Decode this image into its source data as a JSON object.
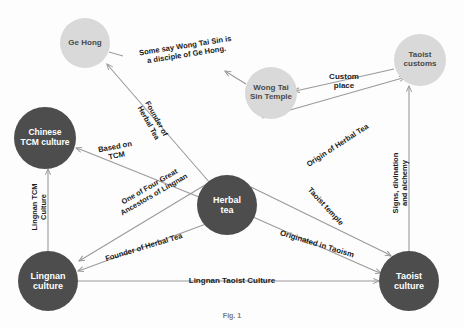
{
  "diagram": {
    "canvas": {
      "width": 464,
      "height": 328,
      "background": "#fdfdfd"
    },
    "colors": {
      "node_dark": "#4d4d4d",
      "node_light": "#d9d9d9",
      "node_light_alt": "#dcdcdc",
      "edge": "#9a9a9a",
      "label_text": "#1a1a1a",
      "node_text_dark_bg": "#ffffff",
      "node_text_light_bg": "#4a4a4a"
    },
    "caption": "Fig. 1",
    "nodes": [
      {
        "id": "ge-hong",
        "label": "Ge Hong",
        "cx": 85,
        "cy": 43,
        "r": 25,
        "style": "light",
        "font_size": 8
      },
      {
        "id": "wong-tai-sin-temple",
        "label": "Wong Tai\nSin Temple",
        "cx": 271,
        "cy": 93,
        "r": 26,
        "style": "light",
        "font_size": 8
      },
      {
        "id": "taoist-customs",
        "label": "Taoist\ncustoms",
        "cx": 420,
        "cy": 60,
        "r": 26,
        "style": "light",
        "font_size": 8
      },
      {
        "id": "chinese-tcm-culture",
        "label": "Chinese\nTCM culture",
        "cx": 45,
        "cy": 138,
        "r": 31,
        "style": "dark",
        "font_size": 8.5
      },
      {
        "id": "herbal-tea",
        "label": "Herbal\ntea",
        "cx": 227,
        "cy": 205,
        "r": 30,
        "style": "dark",
        "font_size": 9
      },
      {
        "id": "lingnan-culture",
        "label": "Lingnan\nculture",
        "cx": 48,
        "cy": 281,
        "r": 30,
        "style": "dark",
        "font_size": 9
      },
      {
        "id": "taoist-culture",
        "label": "Taoist\nculture",
        "cx": 409,
        "cy": 281,
        "r": 30,
        "style": "dark",
        "font_size": 9
      }
    ],
    "edges": [
      {
        "id": "wts-temple-to-ge-hong",
        "from": "wong-tai-sin-temple",
        "to": "ge-hong",
        "label": "Some say Wong Tai Sin is\na disciple of Ge Hong.",
        "label_x": 186,
        "label_y": 51,
        "label_rotation": -9,
        "font_size": 7.6,
        "arrow": "end"
      },
      {
        "id": "herbal-tea-to-ge-hong",
        "from": "herbal-tea",
        "to": "ge-hong",
        "label": "Founder of\nHerbal Tea",
        "label_x": 152,
        "label_y": 121,
        "label_rotation": 61,
        "font_size": 7.4,
        "arrow": "end"
      },
      {
        "id": "herbal-tea-to-chinese-tcm",
        "from": "herbal-tea",
        "to": "chinese-tcm-culture",
        "label": "Based on\nTCM",
        "label_x": 116,
        "label_y": 152,
        "label_rotation": -11,
        "font_size": 7.6,
        "arrow": "end"
      },
      {
        "id": "herbal-tea-to-lingnan-culture-ancestors",
        "from": "herbal-tea",
        "to": "lingnan-culture",
        "label": "One of Four Great\nAncestors of Lingnan",
        "label_x": 152,
        "label_y": 191,
        "label_rotation": -30,
        "font_size": 7.4,
        "arrow": "end"
      },
      {
        "id": "herbal-tea-to-lingnan-culture-founder",
        "from": "herbal-tea",
        "to": "lingnan-culture",
        "label": "Founder of Herbal Tea",
        "label_x": 144,
        "label_y": 248,
        "label_rotation": -17,
        "font_size": 7.6,
        "arrow": "end"
      },
      {
        "id": "lingnan-culture-to-chinese-tcm",
        "from": "lingnan-culture",
        "to": "chinese-tcm-culture",
        "label": "Lingnan TCM\nCulture",
        "label_x": 40,
        "label_y": 207,
        "label_rotation": -90,
        "font_size": 7.4,
        "arrow": "end"
      },
      {
        "id": "taoist-customs-to-wts-temple",
        "from": "taoist-customs",
        "to": "wong-tai-sin-temple",
        "label": "Custom\nplace",
        "label_x": 344,
        "label_y": 81,
        "label_rotation": 0,
        "font_size": 8,
        "arrow": "end"
      },
      {
        "id": "wts-temple-to-taoist-customs-origin",
        "from": "wong-tai-sin-temple",
        "to": "taoist-customs",
        "label": "Origin of Herbal Tea",
        "label_x": 338,
        "label_y": 146,
        "label_rotation": -33,
        "font_size": 7.6,
        "arrow": "end"
      },
      {
        "id": "herbal-tea-to-taoist-culture-temple",
        "from": "herbal-tea",
        "to": "taoist-culture",
        "label": "Taoist temple",
        "label_x": 325,
        "label_y": 207,
        "label_rotation": 47,
        "font_size": 7.6,
        "arrow": "end"
      },
      {
        "id": "herbal-tea-to-taoist-culture-origin",
        "from": "herbal-tea",
        "to": "taoist-culture",
        "label": "Originated in Taoism",
        "label_x": 317,
        "label_y": 244,
        "label_rotation": 17,
        "font_size": 7.8,
        "arrow": "end"
      },
      {
        "id": "lingnan-culture-to-taoist-culture",
        "from": "lingnan-culture",
        "to": "taoist-culture",
        "label": "Lingnan Taoist Culture",
        "label_x": 232,
        "label_y": 281,
        "label_rotation": 0,
        "font_size": 8,
        "arrow": "end"
      },
      {
        "id": "taoist-culture-to-taoist-customs",
        "from": "taoist-culture",
        "to": "taoist-customs",
        "label": "Signs, divination and alchemy",
        "label_x": 401,
        "label_y": 183,
        "label_rotation": -90,
        "font_size": 7.6,
        "arrow": "end"
      }
    ],
    "lines": [
      {
        "id": "line-1",
        "x1": 109,
        "y1": 52,
        "x2": 123,
        "y2": 56,
        "arrow": "none"
      },
      {
        "id": "line-2",
        "x1": 246,
        "y1": 84,
        "x2": 233,
        "y2": 76,
        "arrow": "end",
        "ax": 225,
        "ay": 71
      },
      {
        "id": "line-3",
        "x1": 210,
        "y1": 183,
        "x2": 112,
        "y2": 70,
        "arrow": "end",
        "ax": 107,
        "ay": 64
      },
      {
        "id": "line-4",
        "x1": 199,
        "y1": 197,
        "x2": 82,
        "y2": 150,
        "arrow": "end",
        "ax": 76,
        "ay": 148
      },
      {
        "id": "line-5",
        "x1": 205,
        "y1": 185,
        "x2": 84,
        "y2": 258,
        "arrow": "end",
        "ax": 79,
        "ay": 261
      },
      {
        "id": "line-6",
        "x1": 206,
        "y1": 224,
        "x2": 84,
        "y2": 269,
        "arrow": "end",
        "ax": 78,
        "ay": 271
      },
      {
        "id": "line-7",
        "x1": 48,
        "y1": 251,
        "x2": 48,
        "y2": 175,
        "arrow": "end",
        "ax": 48,
        "ay": 169
      },
      {
        "id": "line-8",
        "x1": 394,
        "y1": 69,
        "x2": 300,
        "y2": 90,
        "arrow": "end",
        "ax": 294,
        "ay": 91
      },
      {
        "id": "line-9",
        "x1": 262,
        "y1": 118,
        "x2": 399,
        "y2": 79,
        "arrow": "end",
        "ax": 405,
        "ay": 77
      },
      {
        "id": "line-10",
        "x1": 251,
        "y1": 187,
        "x2": 386,
        "y2": 253,
        "arrow": "end",
        "ax": 391,
        "ay": 256
      },
      {
        "id": "line-11",
        "x1": 253,
        "y1": 217,
        "x2": 375,
        "y2": 271,
        "arrow": "end",
        "ax": 381,
        "ay": 273
      },
      {
        "id": "line-12",
        "x1": 78,
        "y1": 281,
        "x2": 373,
        "y2": 281,
        "arrow": "end",
        "ax": 379,
        "ay": 281
      },
      {
        "id": "line-13",
        "x1": 409,
        "y1": 251,
        "x2": 409,
        "y2": 92,
        "arrow": "end",
        "ax": 409,
        "ay": 86
      }
    ]
  }
}
